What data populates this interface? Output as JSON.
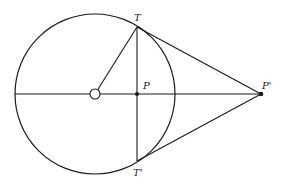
{
  "diagram": {
    "stroke_color": "#1a1a1a",
    "background": "#ffffff",
    "circle": {
      "cx": 95,
      "cy": 94,
      "r": 80
    },
    "center_marker": {
      "cx": 95,
      "cy": 94,
      "r": 5
    },
    "points": {
      "T": {
        "label": "T",
        "x": 137,
        "y": 27
      },
      "T_prime": {
        "label": "T'",
        "x": 137,
        "y": 161
      },
      "P": {
        "label": "P",
        "x": 137,
        "y": 94
      },
      "P_prime": {
        "label": "P'",
        "x": 261,
        "y": 94
      }
    },
    "segments": [
      {
        "name": "radius-OT",
        "from": "O",
        "to": "T"
      },
      {
        "name": "chord-TT'",
        "from": "T",
        "to": "T'"
      },
      {
        "name": "axis-line",
        "from": "left-edge",
        "to": "P'"
      },
      {
        "name": "tangent-TP'",
        "from": "T",
        "to": "P'"
      },
      {
        "name": "tangent-T'P'",
        "from": "T'",
        "to": "P'"
      }
    ]
  }
}
